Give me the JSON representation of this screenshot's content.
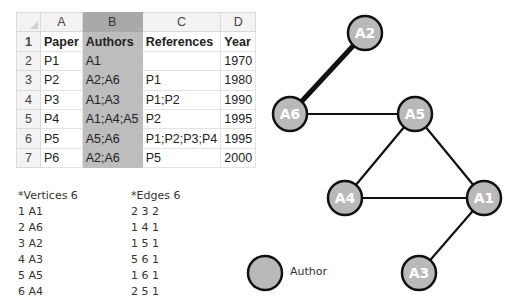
{
  "spreadsheet": {
    "column_headers": [
      "A",
      "B",
      "C",
      "D"
    ],
    "rows": [
      {
        "num": "1",
        "cells": [
          "Paper",
          "Authors",
          "References",
          "Year"
        ]
      },
      {
        "num": "2",
        "cells": [
          "P1",
          "A1",
          "",
          "1970"
        ]
      },
      {
        "num": "3",
        "cells": [
          "P2",
          "A2;A6",
          "P1",
          "1980"
        ]
      },
      {
        "num": "4",
        "cells": [
          "P3",
          "A1;A3",
          "P1;P2",
          "1990"
        ]
      },
      {
        "num": "5",
        "cells": [
          "P4",
          "A1;A4;A5",
          "P2",
          "1995"
        ]
      },
      {
        "num": "6",
        "cells": [
          "P5",
          "A5;A6",
          "P1;P2;P3;P4",
          "1995"
        ]
      },
      {
        "num": "7",
        "cells": [
          "P6",
          "A2;A6",
          "P5",
          "2000"
        ]
      }
    ],
    "selected_column": "B"
  },
  "pajek": {
    "vertices_header": "*Vertices 6",
    "vertices": [
      "1 A1",
      "2 A6",
      "3 A2",
      "4 A3",
      "5 A5",
      "6 A4"
    ],
    "edges_header": "*Edges 6",
    "edges": [
      "2 3 2",
      "1 4 1",
      "1 5 1",
      "5 6 1",
      "1 6 1",
      "2 5 1"
    ]
  },
  "graph": {
    "node_fill": "#b9b9b9",
    "node_stroke": "#111111",
    "nodes": [
      {
        "id": "A2",
        "label": "A2",
        "x": 365,
        "y": 33
      },
      {
        "id": "A6",
        "label": "A6",
        "x": 290,
        "y": 114
      },
      {
        "id": "A5",
        "label": "A5",
        "x": 415,
        "y": 114
      },
      {
        "id": "A4",
        "label": "A4",
        "x": 345,
        "y": 198
      },
      {
        "id": "A1",
        "label": "A1",
        "x": 484,
        "y": 198
      },
      {
        "id": "A3",
        "label": "A3",
        "x": 419,
        "y": 273
      }
    ],
    "edges": [
      {
        "source": "A6",
        "target": "A2",
        "weight": 2
      },
      {
        "source": "A1",
        "target": "A3",
        "weight": 1
      },
      {
        "source": "A1",
        "target": "A5",
        "weight": 1
      },
      {
        "source": "A5",
        "target": "A4",
        "weight": 1
      },
      {
        "source": "A1",
        "target": "A4",
        "weight": 1
      },
      {
        "source": "A6",
        "target": "A5",
        "weight": 1
      }
    ]
  },
  "legend": {
    "label": "Author"
  }
}
